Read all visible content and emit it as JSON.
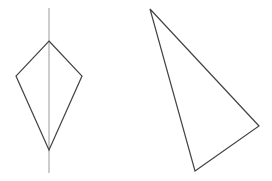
{
  "figure": {
    "width": 272,
    "height": 181,
    "background": "#ffffff",
    "stroke_color": "#444444",
    "axis_color": "#9a9a9a"
  },
  "shapes": {
    "kite": {
      "label": "kite",
      "axis_of_symmetry": {
        "x1": 49,
        "y1": 8,
        "x2": 49,
        "y2": 173
      },
      "vertices": [
        [
          49,
          41
        ],
        [
          82,
          76
        ],
        [
          49,
          150
        ],
        [
          16,
          76
        ]
      ]
    },
    "triangle": {
      "label": "triangle",
      "vertices": [
        [
          150,
          9
        ],
        [
          259,
          126
        ],
        [
          195,
          171
        ]
      ]
    }
  }
}
